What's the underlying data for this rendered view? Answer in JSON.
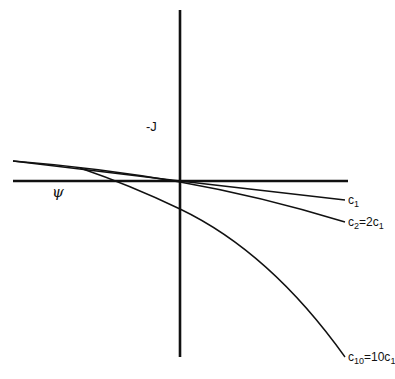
{
  "diagram": {
    "axes": {
      "vertical_label": "-J",
      "horizontal_label": "ψ",
      "origin": [
        180,
        181
      ],
      "vertical_range_px": [
        10,
        357
      ],
      "horizontal_range_px": [
        13,
        348
      ]
    },
    "curves": [
      {
        "id": "c1",
        "label_main": "c",
        "label_sub": "1",
        "label_rest": "",
        "end_px": [
          345,
          200
        ]
      },
      {
        "id": "c2",
        "label_main": "c",
        "label_sub": "2",
        "label_rest": "=2c",
        "label_rest_sub": "1",
        "end_px": [
          345,
          222
        ]
      },
      {
        "id": "c10",
        "label_main": "c",
        "label_sub": "10",
        "label_rest": "=10c",
        "label_rest_sub": "1",
        "end_px": [
          345,
          357
        ]
      }
    ],
    "colors": {
      "ink": "#111111",
      "background": "#ffffff"
    }
  }
}
